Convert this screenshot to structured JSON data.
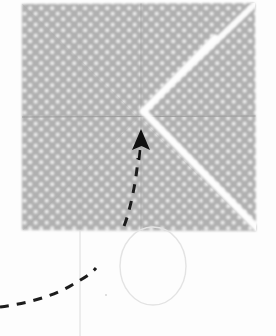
{
  "figure": {
    "caption": "Polka-dot square of paper with valley creases, a pointing arrow and a dashed fold path",
    "background_color": "#fdfdfd"
  },
  "paper": {
    "label": "polka-dot paper sheet",
    "fill_color": "#b0b0b0",
    "dot_color": "#f2f2f2",
    "dot_radius": 1.9,
    "dot_spacing": 11,
    "bounds": {
      "left": 22,
      "top": 3,
      "right": 256,
      "bottom": 231
    },
    "outline_points": "22,4 255,3 256,231 22,230"
  },
  "creases": [
    {
      "name": "horizontal-midline-crease",
      "kind": "crease-line",
      "color": "#9a9a9a",
      "points": "22,117 256,116"
    },
    {
      "name": "vertical-center-crease",
      "kind": "crease-line",
      "color": "#a2a2a2",
      "points": "141,3 141,231"
    },
    {
      "name": "quarter-crease-left",
      "kind": "crease-line",
      "color": "#a6a6a6",
      "points": "80,3 80,231"
    },
    {
      "name": "quarter-crease-right",
      "kind": "crease-line",
      "color": "#a6a6a6",
      "points": "200,3 200,231"
    }
  ],
  "white_folds": [
    {
      "name": "diagonal-crease-upper-right",
      "kind": "white-highlight-fold",
      "color": "#fbfbfb",
      "width": 6,
      "points": "256,3 146,108"
    },
    {
      "name": "v-crease-upper-arm",
      "kind": "white-highlight-fold",
      "color": "#fdfdfd",
      "width": 7,
      "points": "214,40 144,112"
    },
    {
      "name": "v-crease-lower-arm",
      "kind": "white-highlight-fold",
      "color": "#fdfdfd",
      "width": 7,
      "points": "144,112 256,227"
    }
  ],
  "arrow": {
    "name": "fold-direction-arrow",
    "color": "#101010",
    "tip": {
      "x": 141,
      "y": 130
    },
    "tail": {
      "x": 139,
      "y": 160
    },
    "head_width": 17,
    "head_height": 19
  },
  "dashed_path": {
    "name": "fold-motion-dashed-curve",
    "color": "#1c1c1c",
    "width": 3,
    "dash": "9 8",
    "points": "0,307 34,301 68,288 96,268 118,243 131,212 136,176 138,158"
  },
  "pencil_marks": [
    {
      "name": "pencil-vertical-guide-line",
      "kind": "faint-guide",
      "color": "#dcdcdc",
      "width": 1,
      "points": "80,231 80,336"
    },
    {
      "name": "pencil-oval-outline",
      "kind": "faint-oval",
      "color": "#e3e3e3",
      "width": 1.4,
      "center": {
        "x": 153,
        "y": 266
      },
      "radius_x": 33,
      "radius_y": 39
    },
    {
      "name": "pencil-dot-speck",
      "kind": "faint-speck",
      "color": "#d8d8d8",
      "center": {
        "x": 106,
        "y": 295
      },
      "radius": 1.1
    }
  ]
}
